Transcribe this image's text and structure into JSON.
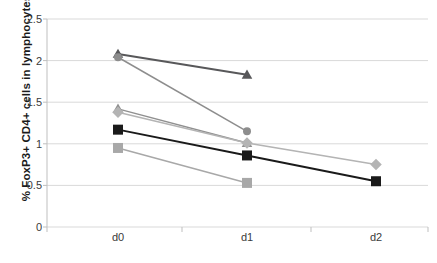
{
  "chart_data": {
    "type": "line",
    "title": "",
    "xlabel": "",
    "ylabel": "% FoxP3+ CD4+ cells in lymphocytes",
    "categories": [
      "d0",
      "d1",
      "d2"
    ],
    "ylim": [
      0,
      2.5
    ],
    "yticks": [
      "0",
      "0.5",
      "1",
      "1.5",
      "2",
      "2.5"
    ],
    "ytick_values": [
      0,
      0.5,
      1,
      1.5,
      2,
      2.5
    ],
    "grid": true,
    "legend": "none",
    "series": [
      {
        "name": "patient-1",
        "marker": "triangle",
        "color": "#58585a",
        "x": [
          "d0",
          "d1"
        ],
        "values": [
          2.08,
          1.83
        ]
      },
      {
        "name": "patient-2",
        "marker": "circle",
        "color": "#8d8d8d",
        "x": [
          "d0",
          "d1"
        ],
        "values": [
          2.04,
          1.15
        ]
      },
      {
        "name": "patient-3",
        "marker": "triangle",
        "color": "#909090",
        "x": [
          "d0",
          "d1"
        ],
        "values": [
          1.42,
          1.01
        ]
      },
      {
        "name": "patient-4",
        "marker": "diamond",
        "color": "#b4b4b4",
        "x": [
          "d0",
          "d1",
          "d2"
        ],
        "values": [
          1.38,
          1.01,
          0.75
        ]
      },
      {
        "name": "patient-5",
        "marker": "square",
        "color": "#1a1a1a",
        "x": [
          "d0",
          "d1",
          "d2"
        ],
        "values": [
          1.17,
          0.86,
          0.55
        ]
      },
      {
        "name": "patient-6",
        "marker": "square",
        "color": "#a8a8a8",
        "x": [
          "d0",
          "d1"
        ],
        "values": [
          0.95,
          0.53
        ]
      }
    ],
    "colors": {
      "grid": "#d9d9d9",
      "axis": "#bfbfbf",
      "text": "#3a3a3a",
      "label": "#1a1a1a"
    }
  }
}
